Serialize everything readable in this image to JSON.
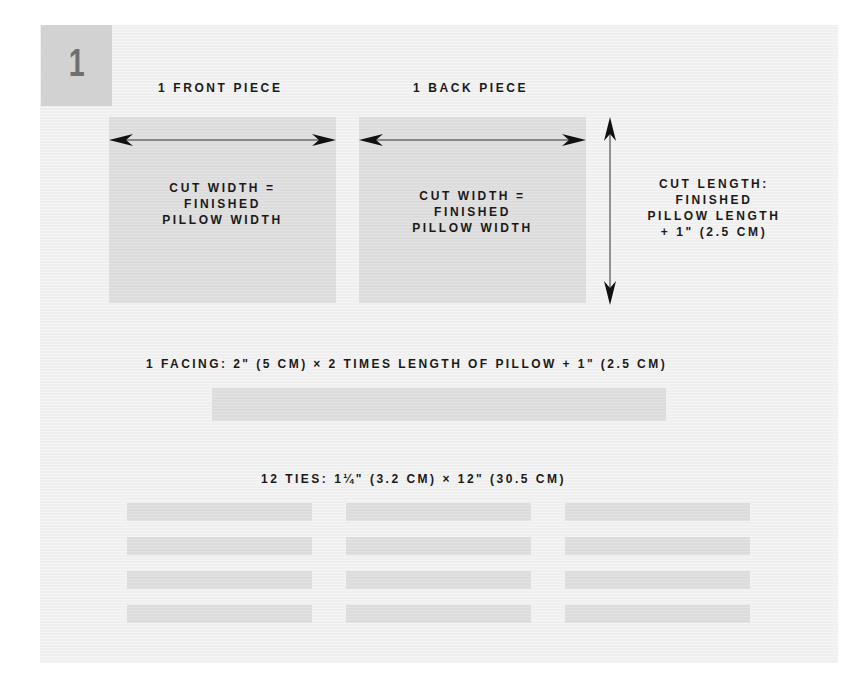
{
  "step": {
    "number": "1"
  },
  "front_piece": {
    "title": "1 FRONT PIECE",
    "lines": [
      "CUT WIDTH =",
      "FINISHED",
      "PILLOW WIDTH"
    ]
  },
  "back_piece": {
    "title": "1 BACK PIECE",
    "lines": [
      "CUT WIDTH =",
      "FINISHED",
      "PILLOW WIDTH"
    ]
  },
  "cut_length": {
    "lines": [
      "CUT LENGTH:",
      "FINISHED",
      "PILLOW LENGTH",
      "+ 1\" (2.5 CM)"
    ]
  },
  "facing": {
    "label": "1 FACING: 2\" (5 CM) × 2 TIMES LENGTH OF PILLOW + 1\" (2.5 CM)"
  },
  "ties": {
    "label": "12 TIES: 1¼\" (3.2 CM) × 12\" (30.5 CM)",
    "count": 12,
    "columns": 3,
    "rows": 4
  },
  "colors": {
    "panel_bg": "#efefef",
    "piece_fill": "#dcdcdc",
    "badge_fill": "#d2d2d2",
    "badge_text": "#6f6f6f",
    "text": "#1a1a1a"
  }
}
